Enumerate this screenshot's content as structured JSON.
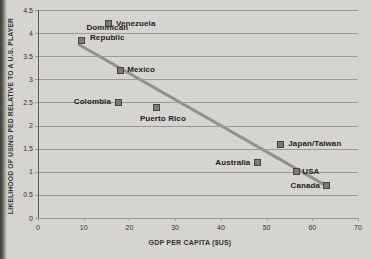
{
  "colors": {
    "paper": "#d6d4d0",
    "ink": "#34332f",
    "label_ink": "#23221e",
    "grid": "#9c9a95",
    "axis": "#5d5c57",
    "marker_fill": "#7c7a76",
    "marker_border": "#454440",
    "trendline": "#93918d"
  },
  "chart_data": {
    "type": "scatter",
    "title": "",
    "xlabel": "GDP PER CAPITA ($US)",
    "ylabel": "LIKELIHOOD OF USING PED RELATIVE TO A U.S. PLAYER",
    "xlim": [
      0,
      70
    ],
    "ylim": [
      0,
      4.5
    ],
    "x_ticks": [
      0,
      10,
      20,
      30,
      40,
      50,
      60,
      70
    ],
    "y_ticks": [
      0,
      0.5,
      1,
      1.5,
      2,
      2.5,
      3,
      3.5,
      4,
      4.5
    ],
    "grid": "horizontal",
    "legend": "none",
    "points": [
      {
        "label": "Venezuela",
        "lines": [
          "Venezuela"
        ],
        "x": 15.5,
        "y": 4.2,
        "anchor": "start",
        "dx": 7,
        "dy": 0
      },
      {
        "label": "Dominican Republic",
        "lines": [
          "Dominican",
          "Republic"
        ],
        "x": 9.5,
        "y": 3.85,
        "anchor": "start",
        "dx": 5,
        "dy": -7
      },
      {
        "label": "Mexico",
        "lines": [
          "Mexico"
        ],
        "x": 18,
        "y": 3.2,
        "anchor": "start",
        "dx": 7,
        "dy": 0
      },
      {
        "label": "Colombia",
        "lines": [
          "Colombia"
        ],
        "x": 17.5,
        "y": 2.5,
        "anchor": "end",
        "dx": -7,
        "dy": 0
      },
      {
        "label": "Puerto Rico",
        "lines": [
          "Puerto Rico"
        ],
        "x": 26,
        "y": 2.4,
        "anchor": "middle",
        "dx": 6,
        "dy": 12
      },
      {
        "label": "Japan/Taiwan",
        "lines": [
          "Japan/Taiwan"
        ],
        "x": 53,
        "y": 1.6,
        "anchor": "start",
        "dx": 8,
        "dy": 0
      },
      {
        "label": "Australia",
        "lines": [
          "Australia"
        ],
        "x": 48,
        "y": 1.2,
        "anchor": "end",
        "dx": -7,
        "dy": 0
      },
      {
        "label": "USA",
        "lines": [
          "USA"
        ],
        "x": 56.5,
        "y": 1.0,
        "anchor": "start",
        "dx": 6,
        "dy": 0
      },
      {
        "label": "Canada",
        "lines": [
          "Canada"
        ],
        "x": 63,
        "y": 0.7,
        "anchor": "end",
        "dx": -6,
        "dy": 0
      }
    ],
    "trendline": {
      "x1": 9,
      "y1": 3.75,
      "x2": 63,
      "y2": 0.7
    }
  }
}
